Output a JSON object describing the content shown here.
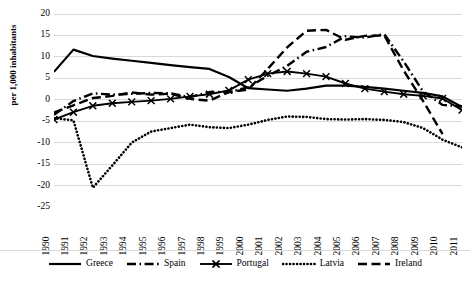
{
  "chart_data": {
    "type": "line",
    "title": "",
    "xlabel": "",
    "ylabel": "per 1,000 inhabitants",
    "ylim": [
      -25,
      20
    ],
    "ytick_values": [
      20,
      15,
      10,
      5,
      0,
      -5,
      -10,
      -15,
      -20,
      -25
    ],
    "grid": true,
    "legend_position": "bottom",
    "categories": [
      "1990",
      "1991",
      "1992",
      "1993",
      "1994",
      "1995",
      "1996",
      "1997",
      "1998",
      "1999",
      "2000",
      "2001",
      "2002",
      "2003",
      "2004",
      "2005",
      "2006",
      "2007",
      "2008",
      "2009",
      "2010",
      "2011"
    ],
    "series": [
      {
        "name": "Greece",
        "style": "solid",
        "color": "#000000",
        "values": [
          6.5,
          11.7,
          10.2,
          9.6,
          9.1,
          8.6,
          8.1,
          7.6,
          7.2,
          5.3,
          2.7,
          2.4,
          2.1,
          2.6,
          3.3,
          3.3,
          3.0,
          2.6,
          2.1,
          1.6,
          0.8,
          -1.7
        ]
      },
      {
        "name": "Spain",
        "style": "dash-dot",
        "color": "#000000",
        "values": [
          -3.5,
          -0.3,
          1.5,
          1.2,
          1.4,
          1.6,
          1.5,
          0.6,
          1.8,
          1.8,
          2.9,
          5.6,
          7.9,
          11.2,
          12.3,
          14.8,
          14.5,
          15.3,
          8.9,
          1.9,
          -1.2,
          -1.5
        ]
      },
      {
        "name": "Portugal",
        "style": "solid-x",
        "color": "#000000",
        "values": [
          -4.6,
          -2.9,
          -1.4,
          -0.8,
          -0.5,
          -0.2,
          0.2,
          0.8,
          1.3,
          2.2,
          4.7,
          6.1,
          6.6,
          6.1,
          5.4,
          3.8,
          2.6,
          1.9,
          1.3,
          0.9,
          0.3,
          -2.4
        ]
      },
      {
        "name": "Latvia",
        "style": "dotted",
        "color": "#000000",
        "values": [
          -4.3,
          -4.8,
          -20.5,
          -15.3,
          -10.0,
          -7.4,
          -6.6,
          -5.8,
          -6.4,
          -6.6,
          -5.8,
          -4.7,
          -3.9,
          -4.0,
          -4.5,
          -4.6,
          -4.5,
          -4.7,
          -5.2,
          -6.6,
          -9.3,
          -11.1
        ]
      },
      {
        "name": "Ireland",
        "style": "dashed",
        "color": "#000000",
        "values": [
          -3.0,
          -1.3,
          0.4,
          0.9,
          1.7,
          1.2,
          1.4,
          0.2,
          -0.2,
          1.8,
          2.4,
          7.2,
          12.2,
          16.1,
          16.3,
          14.0,
          14.9,
          15.0,
          6.8,
          -0.3,
          -8.0,
          null
        ]
      }
    ]
  },
  "yaxis": {
    "label": "per 1,000 inhabitants",
    "ticks": [
      "20",
      "15",
      "10",
      "5",
      "0",
      "-5",
      "-10",
      "-15",
      "-20",
      "-25"
    ]
  },
  "xaxis": {
    "ticks": [
      "1990",
      "1991",
      "1992",
      "1993",
      "1994",
      "1995",
      "1996",
      "1997",
      "1998",
      "1999",
      "2000",
      "2001",
      "2002",
      "2003",
      "2004",
      "2005",
      "2006",
      "2007",
      "2008",
      "2009",
      "2010",
      "2011"
    ]
  },
  "legend": {
    "items": [
      {
        "label": "Greece",
        "style": "solid"
      },
      {
        "label": "Spain",
        "style": "dash-dot"
      },
      {
        "label": "Portugal",
        "style": "solid-x"
      },
      {
        "label": "Latvia",
        "style": "dotted"
      },
      {
        "label": "Ireland",
        "style": "dashed"
      }
    ]
  },
  "colors": {
    "ink": "#000000",
    "grid": "#d9d9d9",
    "background": "#ffffff"
  }
}
